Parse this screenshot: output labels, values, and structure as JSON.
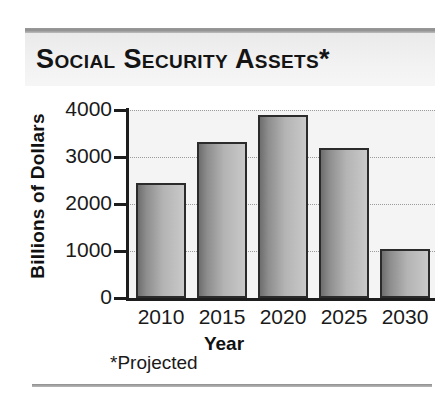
{
  "header": {
    "title": "Social Security Assets*"
  },
  "footnote": "*Projected",
  "chart_data": {
    "type": "bar",
    "title": "Social Security Assets*",
    "categories": [
      "2010",
      "2015",
      "2020",
      "2025",
      "2030"
    ],
    "values": [
      2450,
      3320,
      3900,
      3200,
      1050
    ],
    "xlabel": "Year",
    "ylabel": "Billions of Dollars",
    "ylim": [
      0,
      4000
    ],
    "ytick_labels": [
      "0",
      "1000",
      "2000",
      "3000",
      "4000"
    ],
    "ytick_values": [
      0,
      1000,
      2000,
      3000,
      4000
    ],
    "grid": true,
    "gridline_style": "dotted",
    "legend": null,
    "annotations": [
      "*Projected"
    ],
    "bar_color": "#a0a0a0",
    "bar_edge_color": "#2b2b2b",
    "plot_background": "#f4f4f4"
  }
}
